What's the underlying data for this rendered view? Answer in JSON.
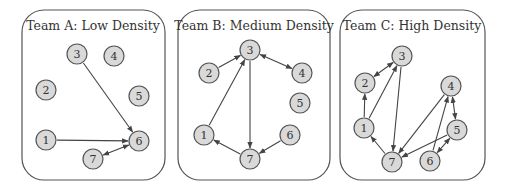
{
  "figure": {
    "panels": [
      {
        "id": "A",
        "title": "Team A: Low Density",
        "box": {
          "x": 22,
          "y": 10,
          "w": 143,
          "h": 170,
          "r": 22
        },
        "title_pos": {
          "x": 93,
          "y": 30
        },
        "nodes": [
          {
            "id": "1",
            "x": 46,
            "y": 140
          },
          {
            "id": "2",
            "x": 46,
            "y": 90
          },
          {
            "id": "3",
            "x": 77,
            "y": 54
          },
          {
            "id": "4",
            "x": 114,
            "y": 56
          },
          {
            "id": "5",
            "x": 139,
            "y": 96
          },
          {
            "id": "6",
            "x": 139,
            "y": 141
          },
          {
            "id": "7",
            "x": 93,
            "y": 159
          }
        ],
        "edges": [
          {
            "from": "3",
            "to": "6",
            "bidirectional": false
          },
          {
            "from": "1",
            "to": "6",
            "bidirectional": false
          },
          {
            "from": "7",
            "to": "6",
            "bidirectional": true
          }
        ]
      },
      {
        "id": "B",
        "title": "Team B: Medium Density",
        "box": {
          "x": 178,
          "y": 10,
          "w": 152,
          "h": 170,
          "r": 22
        },
        "title_pos": {
          "x": 254,
          "y": 30
        },
        "nodes": [
          {
            "id": "1",
            "x": 204,
            "y": 135
          },
          {
            "id": "2",
            "x": 209,
            "y": 73
          },
          {
            "id": "3",
            "x": 250,
            "y": 50
          },
          {
            "id": "4",
            "x": 302,
            "y": 73
          },
          {
            "id": "5",
            "x": 300,
            "y": 103
          },
          {
            "id": "6",
            "x": 290,
            "y": 135
          },
          {
            "id": "7",
            "x": 250,
            "y": 159
          }
        ],
        "edges": [
          {
            "from": "2",
            "to": "3",
            "bidirectional": false
          },
          {
            "from": "1",
            "to": "3",
            "bidirectional": false
          },
          {
            "from": "3",
            "to": "4",
            "bidirectional": true
          },
          {
            "from": "3",
            "to": "7",
            "bidirectional": false
          },
          {
            "from": "6",
            "to": "7",
            "bidirectional": false
          },
          {
            "from": "7",
            "to": "1",
            "bidirectional": false
          }
        ]
      },
      {
        "id": "C",
        "title": "Team C: High Density",
        "box": {
          "x": 340,
          "y": 10,
          "w": 145,
          "h": 170,
          "r": 22
        },
        "title_pos": {
          "x": 412,
          "y": 30
        },
        "nodes": [
          {
            "id": "1",
            "x": 364,
            "y": 128
          },
          {
            "id": "2",
            "x": 365,
            "y": 83
          },
          {
            "id": "3",
            "x": 402,
            "y": 56
          },
          {
            "id": "4",
            "x": 451,
            "y": 86
          },
          {
            "id": "5",
            "x": 457,
            "y": 130
          },
          {
            "id": "6",
            "x": 430,
            "y": 161
          },
          {
            "id": "7",
            "x": 392,
            "y": 162
          }
        ],
        "edges": [
          {
            "from": "2",
            "to": "3",
            "bidirectional": true
          },
          {
            "from": "1",
            "to": "2",
            "bidirectional": false
          },
          {
            "from": "1",
            "to": "3",
            "bidirectional": false
          },
          {
            "from": "3",
            "to": "7",
            "bidirectional": false
          },
          {
            "from": "7",
            "to": "1",
            "bidirectional": false
          },
          {
            "from": "4",
            "to": "7",
            "bidirectional": false
          },
          {
            "from": "5",
            "to": "7",
            "bidirectional": false
          },
          {
            "from": "6",
            "to": "4",
            "bidirectional": false
          },
          {
            "from": "4",
            "to": "5",
            "bidirectional": true
          },
          {
            "from": "6",
            "to": "5",
            "bidirectional": true
          }
        ]
      }
    ],
    "node_radius": 10,
    "colors": {
      "node_fill": "#d9d9d9",
      "node_stroke": "#555555",
      "edge": "#444444",
      "panel_stroke": "#555555",
      "text": "#333333"
    }
  }
}
